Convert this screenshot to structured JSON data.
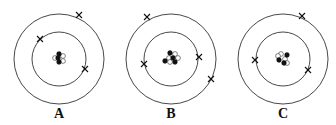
{
  "figure": {
    "atoms": [
      {
        "label": "A",
        "center": [
          59,
          59
        ],
        "shells": [
          27,
          45
        ],
        "electrons": [
          {
            "shell": 0,
            "pos": [
              40,
              39
            ]
          },
          {
            "shell": 0,
            "pos": [
              85,
              69
            ]
          },
          {
            "shell": 1,
            "pos": [
              79,
              15
            ]
          }
        ],
        "nucleus": {
          "protons": [
            [
              59,
              54
            ],
            [
              58,
              58
            ],
            [
              59,
              62
            ]
          ],
          "neutrons": [
            [
              55,
              58
            ],
            [
              63,
              56
            ],
            [
              63,
              61
            ]
          ]
        }
      },
      {
        "label": "B",
        "center": [
          171,
          59
        ],
        "shells": [
          27,
          45
        ],
        "electrons": [
          {
            "shell": 0,
            "pos": [
              144,
              64
            ]
          },
          {
            "shell": 0,
            "pos": [
              199,
              57
            ]
          },
          {
            "shell": 1,
            "pos": [
              147,
              17
            ]
          },
          {
            "shell": 1,
            "pos": [
              211,
              79
            ]
          }
        ],
        "nucleus": {
          "protons": [
            [
              170,
              53
            ],
            [
              165,
              61
            ],
            [
              173,
              58
            ],
            [
              175,
              62
            ]
          ],
          "neutrons": [
            [
              175,
              54
            ],
            [
              169,
              58
            ],
            [
              178,
              58
            ],
            [
              170,
              62
            ]
          ]
        }
      },
      {
        "label": "C",
        "center": [
          283,
          59
        ],
        "shells": [
          27,
          45
        ],
        "electrons": [
          {
            "shell": 0,
            "pos": [
              255,
              60
            ]
          },
          {
            "shell": 0,
            "pos": [
              308,
              70
            ]
          },
          {
            "shell": 1,
            "pos": [
              302,
              16
            ]
          }
        ],
        "nucleus": {
          "protons": [
            [
              287,
              55
            ],
            [
              279,
              60
            ],
            [
              284,
              63
            ]
          ],
          "neutrons": [
            [
              281,
              54
            ],
            [
              285,
              59
            ],
            [
              287,
              63
            ],
            [
              278,
              56
            ]
          ]
        }
      }
    ],
    "colors": {
      "stroke": "#333333",
      "proton_fill": "#111111",
      "neutron_fill": "#ffffff"
    }
  }
}
